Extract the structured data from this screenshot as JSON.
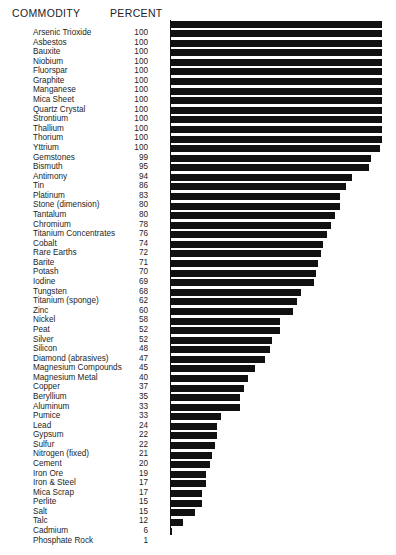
{
  "header": {
    "commodity_label": "COMMODITY",
    "percent_label": "PERCENT"
  },
  "chart_data": {
    "type": "bar",
    "orientation": "horizontal",
    "title": "",
    "xlabel": "PERCENT",
    "ylabel": "COMMODITY",
    "xlim": [
      0,
      100
    ],
    "grid": false,
    "legend": null,
    "categories": [
      "Arsenic Trioxide",
      "Asbestos",
      "Bauxite",
      "Niobium",
      "Fluorspar",
      "Graphite",
      "Manganese",
      "Mica Sheet",
      "Quartz Crystal",
      "Strontium",
      "Thallium",
      "Thorium",
      "Yttrium",
      "Gemstones",
      "Bismuth",
      "Antimony",
      "Tin",
      "Platinum",
      "Stone (dimension)",
      "Tantalum",
      "Chromium",
      "Titanium Concentrates",
      "Cobalt",
      "Rare Earths",
      "Barite",
      "Potash",
      "Iodine",
      "Tungsten",
      "Titanium (sponge)",
      "Zinc",
      "Nickel",
      "Peat",
      "Silver",
      "Silicon",
      "Diamond (abrasives)",
      "Magnesium Compounds",
      "Magnesium Metal",
      "Copper",
      "Beryllium",
      "Aluminum",
      "Pumice",
      "Lead",
      "Gypsum",
      "Sulfur",
      "Nitrogen (fixed)",
      "Cement",
      "Iron Ore",
      "Iron & Steel",
      "Mica Scrap",
      "Perlite",
      "Salt",
      "Talc",
      "Cadmium",
      "Phosphate Rock"
    ],
    "values": [
      100,
      100,
      100,
      100,
      100,
      100,
      100,
      100,
      100,
      100,
      100,
      100,
      100,
      99,
      95,
      94,
      86,
      83,
      80,
      80,
      78,
      76,
      74,
      72,
      71,
      70,
      69,
      68,
      62,
      60,
      58,
      52,
      52,
      48,
      47,
      45,
      40,
      37,
      35,
      33,
      33,
      24,
      22,
      22,
      21,
      20,
      19,
      17,
      17,
      15,
      15,
      12,
      6,
      1
    ],
    "bar_color": "#111111",
    "background_color": "#ffffff"
  }
}
